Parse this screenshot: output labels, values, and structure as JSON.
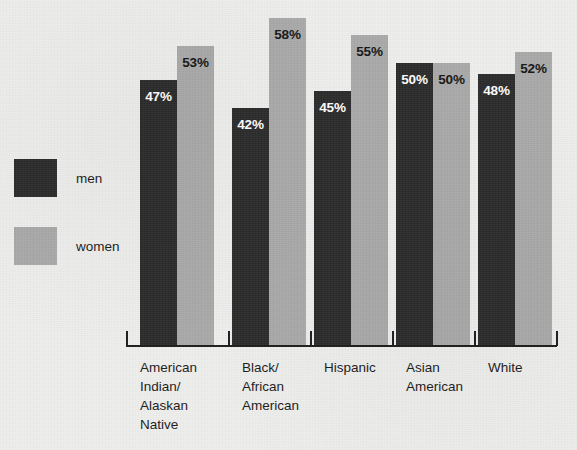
{
  "legend": {
    "position": "left",
    "entries": [
      {
        "key": "men",
        "label": "men",
        "color": "#2b2b2b"
      },
      {
        "key": "women",
        "label": "women",
        "color": "#a9a9a9"
      }
    ]
  },
  "chart_data": {
    "type": "bar",
    "title": "",
    "subtitle": "",
    "xlabel": "",
    "ylabel": "",
    "ylim": [
      0,
      65
    ],
    "grid": false,
    "value_suffix": "%",
    "legend_position": "left",
    "categories": [
      "American Indian/ Alaskan Native",
      "Black/ African American",
      "Hispanic",
      "Asian American",
      "White"
    ],
    "category_lines": [
      [
        "American",
        "Indian/",
        "Alaskan",
        "Native"
      ],
      [
        "Black/",
        "African",
        "American"
      ],
      [
        "Hispanic"
      ],
      [
        "Asian",
        "American"
      ],
      [
        "White"
      ]
    ],
    "series": [
      {
        "name": "men",
        "color": "#2b2b2b",
        "values": [
          47,
          42,
          45,
          50,
          48
        ],
        "labels": [
          "47%",
          "42%",
          "45%",
          "50%",
          "48%"
        ]
      },
      {
        "name": "women",
        "color": "#a9a9a9",
        "values": [
          53,
          58,
          55,
          50,
          52
        ],
        "labels": [
          "53%",
          "58%",
          "55%",
          "50%",
          "52%"
        ]
      }
    ]
  },
  "axis": {
    "line_color": "#1d1d1d",
    "tick_positions": [
      126,
      228,
      310,
      392,
      474,
      556
    ]
  },
  "colors": {
    "background": "#eeeeec",
    "men_bar": "#2b2b2b",
    "women_bar": "#a9a9a9",
    "text": "#1a1a1a"
  }
}
